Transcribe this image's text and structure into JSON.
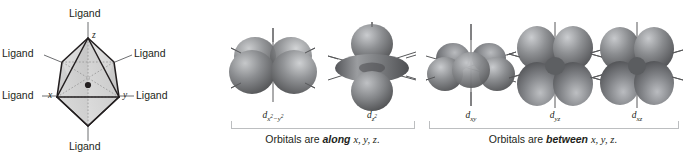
{
  "figure": {
    "colors": {
      "ink": "#231f20",
      "orbital_dark": "#58595b",
      "orbital_mid": "#808285",
      "orbital_light": "#d1d3d4",
      "octahedron_fill": "#d9d9d9",
      "octahedron_edge": "#231f20",
      "leader_line": "#6d6e71",
      "rule": "#bcbec0",
      "background": "#ffffff"
    }
  },
  "octahedron": {
    "name": "octahedral-complex-diagram",
    "ligands": [
      {
        "id": "ligand-top",
        "label": "Ligand"
      },
      {
        "id": "ligand-upper-left",
        "label": "Ligand"
      },
      {
        "id": "ligand-upper-right",
        "label": "Ligand"
      },
      {
        "id": "ligand-lower-left",
        "label": "Ligand"
      },
      {
        "id": "ligand-lower-right",
        "label": "Ligand"
      },
      {
        "id": "ligand-bottom",
        "label": "Ligand"
      }
    ],
    "axes": [
      {
        "id": "axis-z",
        "label": "z"
      },
      {
        "id": "axis-x",
        "label": "x"
      },
      {
        "id": "axis-y",
        "label": "y"
      }
    ],
    "center_atom": "metal-center-dot"
  },
  "orbital_groups": [
    {
      "id": "eg-group",
      "caption_prefix": "Orbitals are ",
      "caption_emphasis": "along",
      "caption_suffix_axes": "x, y, z",
      "caption_end": ".",
      "orbitals": [
        {
          "id": "d-x2-y2",
          "symbol": "d",
          "subscript_plain": "x",
          "sub_sup_1": "2",
          "sub_mid": "−y",
          "sub_sup_2": "2",
          "shape": "four-lobe-clover-on-axes"
        },
        {
          "id": "d-z2",
          "symbol": "d",
          "subscript_plain": "z",
          "sub_sup_1": "2",
          "sub_mid": "",
          "sub_sup_2": "",
          "shape": "two-lobe-with-torus"
        }
      ]
    },
    {
      "id": "t2g-group",
      "caption_prefix": "Orbitals are ",
      "caption_emphasis": "between",
      "caption_suffix_axes": "x, y, z",
      "caption_end": ".",
      "orbitals": [
        {
          "id": "d-xy",
          "symbol": "d",
          "subscript_plain": "xy",
          "sub_sup_1": "",
          "sub_mid": "",
          "sub_sup_2": "",
          "shape": "four-lobe-clover-between-axes"
        },
        {
          "id": "d-yz",
          "symbol": "d",
          "subscript_plain": "yz",
          "sub_sup_1": "",
          "sub_mid": "",
          "sub_sup_2": "",
          "shape": "four-lobe-clover-between-axes"
        },
        {
          "id": "d-xz",
          "symbol": "d",
          "subscript_plain": "xz",
          "sub_sup_1": "",
          "sub_mid": "",
          "sub_sup_2": "",
          "shape": "four-lobe-clover-between-axes"
        }
      ]
    }
  ]
}
